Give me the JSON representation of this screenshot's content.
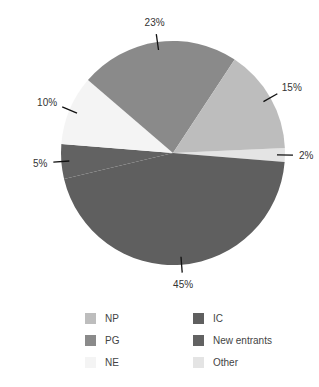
{
  "chart_data": {
    "type": "pie",
    "title": "",
    "start_angle_deg": -2.6,
    "direction": "clockwise",
    "slices": [
      {
        "name": "Other",
        "value": 2,
        "label": "2%",
        "color": "#e4e4e4"
      },
      {
        "name": "IC",
        "value": 45,
        "label": "45%",
        "color": "#5f5f5f"
      },
      {
        "name": "New entrants",
        "value": 5,
        "label": "5%",
        "color": "#626262"
      },
      {
        "name": "NE",
        "value": 10,
        "label": "10%",
        "color": "#f4f4f4"
      },
      {
        "name": "PG",
        "value": 23,
        "label": "23%",
        "color": "#8a8a8a"
      },
      {
        "name": "NP",
        "value": 15,
        "label": "15%",
        "color": "#bdbdbd"
      }
    ],
    "legend": {
      "position": "bottom",
      "columns": [
        [
          "NP",
          "PG",
          "NE"
        ],
        [
          "IC",
          "New entrants",
          "Other"
        ]
      ]
    }
  },
  "legend": {
    "items": [
      {
        "label": "NP",
        "color": "#bdbdbd"
      },
      {
        "label": "PG",
        "color": "#8a8a8a"
      },
      {
        "label": "NE",
        "color": "#f4f4f4"
      },
      {
        "label": "IC",
        "color": "#5f5f5f"
      },
      {
        "label": "New entrants",
        "color": "#626262"
      },
      {
        "label": "Other",
        "color": "#e4e4e4"
      }
    ]
  }
}
